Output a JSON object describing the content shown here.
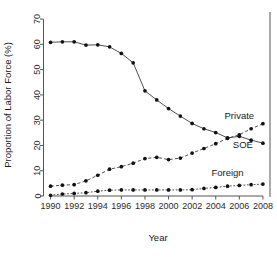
{
  "chart_data": {
    "type": "line",
    "title": "",
    "xlabel": "Year",
    "ylabel": "Proportion of Labor Force (%)",
    "xlim": [
      1989.4,
      2008.6
    ],
    "ylim": [
      0,
      72
    ],
    "grid": false,
    "legend_position": "inline-right",
    "x": [
      1990,
      1991,
      1992,
      1993,
      1994,
      1995,
      1996,
      1997,
      1998,
      1999,
      2000,
      2001,
      2002,
      2003,
      2004,
      2005,
      2006,
      2007,
      2008
    ],
    "xticks": [
      1990,
      1992,
      1994,
      1996,
      1998,
      2000,
      2002,
      2004,
      2006,
      2008
    ],
    "xtick_labels": [
      "1990",
      "1992",
      "1994",
      "1996",
      "1998",
      "2000",
      "2002",
      "2004",
      "2006",
      "2008"
    ],
    "yticks": [
      0,
      10,
      20,
      30,
      40,
      50,
      60,
      70
    ],
    "ytick_labels": [
      "0",
      "10",
      "20",
      "30",
      "40",
      "50",
      "60",
      "70"
    ],
    "series": [
      {
        "name": "Private",
        "style": "solid",
        "marker": "filled-circle",
        "label_x": 2006.0,
        "label_y": 30.5,
        "values": [
          60.8,
          61.0,
          61.0,
          59.7,
          59.8,
          59.0,
          56.4,
          52.7,
          41.6,
          38.0,
          34.6,
          31.6,
          28.7,
          26.6,
          25.1,
          23.0,
          23.6,
          22.1,
          20.9
        ]
      },
      {
        "name": "SOE",
        "style": "dashed",
        "marker": "filled-circle",
        "label_x": 2006.3,
        "label_y": 19.0,
        "values": [
          3.9,
          4.3,
          4.5,
          6.0,
          8.2,
          10.6,
          11.6,
          13.0,
          14.8,
          15.3,
          14.4,
          15.0,
          17.0,
          18.8,
          20.7,
          22.8,
          24.2,
          26.6,
          28.6
        ]
      },
      {
        "name": "Foreign",
        "style": "dotted",
        "marker": "filled-circle",
        "label_x": 2005.0,
        "label_y": 8.0,
        "values": [
          0.3,
          0.8,
          1.0,
          1.3,
          1.9,
          2.3,
          2.4,
          2.4,
          2.4,
          2.4,
          2.4,
          2.4,
          2.5,
          3.0,
          3.4,
          3.9,
          4.2,
          4.5,
          4.7
        ]
      }
    ]
  }
}
